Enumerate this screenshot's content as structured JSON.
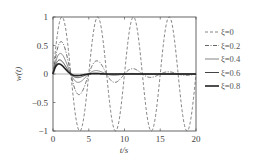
{
  "chart_data": {
    "type": "line",
    "title": "",
    "xlabel": "t/s",
    "ylabel": "w(t)",
    "xlim": [
      0,
      20
    ],
    "ylim": [
      -1,
      1
    ],
    "xticks": [
      0,
      5,
      10,
      15,
      20
    ],
    "yticks": [
      1,
      0.5,
      0,
      -0.5,
      -1
    ],
    "ytick_labels": [
      "1",
      "0.5",
      "0",
      "−0.5",
      "−1"
    ],
    "grid": false,
    "legend_position": "right-outside",
    "note": "Curves below are an approximate visual reconstruction, not values read from the figure. Only axis ranges, ticks, and legend labels are directly visible. Curve shape is a sampled damped sinusoid (period ~5 s, peak near t~1.5-2 s) chosen to resemble the image; the series values are stylized estimates and should not be treated as measured data.",
    "series": [
      {
        "name": "ξ=0",
        "xi": 0.0,
        "style": "dashed",
        "width": 0.8,
        "color": "#666666"
      },
      {
        "name": "ξ=0.2",
        "xi": 0.2,
        "style": "dashdot",
        "width": 0.9,
        "color": "#555555"
      },
      {
        "name": "ξ=0.4",
        "xi": 0.4,
        "style": "solid",
        "width": 0.8,
        "color": "#666666"
      },
      {
        "name": "ξ=0.6",
        "xi": 0.6,
        "style": "solid",
        "width": 1.0,
        "color": "#444444"
      },
      {
        "name": "ξ=0.8",
        "xi": 0.8,
        "style": "solid",
        "width": 1.6,
        "color": "#222222"
      }
    ]
  },
  "legend": {
    "items": [
      {
        "label": "ξ=0"
      },
      {
        "label": "ξ=0.2"
      },
      {
        "label": "ξ=0.4"
      },
      {
        "label": "ξ=0.6"
      },
      {
        "label": "ξ=0.8"
      }
    ]
  }
}
